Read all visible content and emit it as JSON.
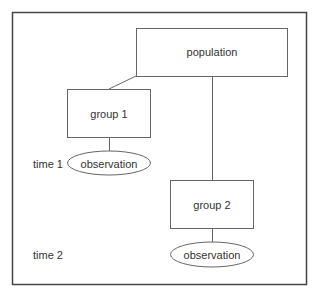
{
  "diagram": {
    "nodes": {
      "population": {
        "label": "population",
        "shape": "rect"
      },
      "group1": {
        "label": "group 1",
        "shape": "rect"
      },
      "group2": {
        "label": "group 2",
        "shape": "rect"
      },
      "observation1": {
        "label": "observation",
        "shape": "ellipse"
      },
      "observation2": {
        "label": "observation",
        "shape": "ellipse"
      }
    },
    "time_labels": [
      "time 1",
      "time 2"
    ],
    "edges": [
      {
        "from": "population",
        "to": "group1"
      },
      {
        "from": "population",
        "to": "group2"
      },
      {
        "from": "group1",
        "to": "observation1"
      },
      {
        "from": "group2",
        "to": "observation2"
      }
    ],
    "colors": {
      "stroke": "#555555",
      "frame": "#444444",
      "text": "#333333",
      "background": "#ffffff"
    }
  }
}
